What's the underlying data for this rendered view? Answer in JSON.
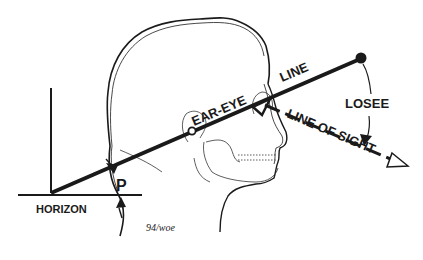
{
  "diagram": {
    "labels": {
      "ear_eye": "EAR-EYE",
      "line": "LINE",
      "losee": "LOSEE",
      "line_of_sight": "LINE OF SIGHT",
      "p": "P",
      "horizon": "HORIZON",
      "signature": "94/woe"
    },
    "colors": {
      "ink": "#1a1a1a",
      "background": "#ffffff"
    }
  }
}
